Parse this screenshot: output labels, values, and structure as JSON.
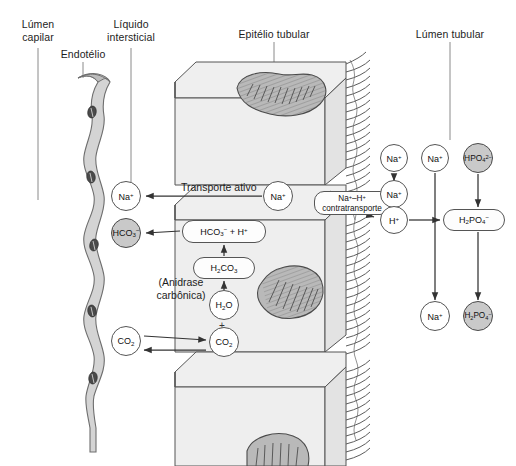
{
  "figure": {
    "language": "pt-BR",
    "background": "#ffffff",
    "ink": "#1d1d1d"
  },
  "region_labels": [
    {
      "id": "lumen-capilar",
      "text": "Lúmen\ncapilar",
      "x": 8,
      "y": 18,
      "w": 60,
      "leader": {
        "x": 38,
        "y1": 48,
        "y2": 200
      }
    },
    {
      "id": "liquido-intersticial",
      "text": "Líquido\nintersticial",
      "x": 94,
      "y": 18,
      "w": 74,
      "leader": {
        "x": 131,
        "y1": 48,
        "y2": 200
      }
    },
    {
      "id": "endotelio",
      "text": "Endotélio",
      "x": 52,
      "y": 48,
      "w": 62,
      "leader": {
        "x": 83,
        "y1": 62,
        "y2": 78
      }
    },
    {
      "id": "epitelio-tubular",
      "text": "Epitélio tubular",
      "x": 226,
      "y": 28,
      "w": 96,
      "leader": {
        "x": 274,
        "y1": 42,
        "y2": 80
      }
    },
    {
      "id": "lumen-tubular",
      "text": "Lúmen tubular",
      "x": 404,
      "y": 28,
      "w": 92,
      "leader": {
        "x": 450,
        "y1": 42,
        "y2": 140
      }
    }
  ],
  "inline_labels": [
    {
      "id": "transporte-ativo",
      "text": "Transporte ativo",
      "x": 181,
      "y": 181,
      "w": 104,
      "align": "left"
    },
    {
      "id": "anidrase-carbonica",
      "text": "(Anidrase\ncarbônica)",
      "x": 147,
      "y": 276,
      "w": 68,
      "align": "center"
    }
  ],
  "nodes": [
    {
      "id": "na-interstitial",
      "label": "Na+",
      "html": "Na<sup>+</sup>",
      "shape": "circle",
      "fill": "white",
      "cx": 126,
      "cy": 196,
      "r": 15
    },
    {
      "id": "hco3-interstitial",
      "label": "HCO3-",
      "html": "HCO<sub>3</sub><sup>−</sup>",
      "shape": "circle",
      "fill": "gray",
      "cx": 126,
      "cy": 233,
      "r": 15
    },
    {
      "id": "co2-interstitial",
      "label": "CO2",
      "html": "CO<sub>2</sub>",
      "shape": "circle",
      "fill": "white",
      "cx": 126,
      "cy": 341,
      "r": 15
    },
    {
      "id": "na-cell",
      "label": "Na+",
      "html": "Na<sup>+</sup>",
      "shape": "circle",
      "fill": "white",
      "cx": 278,
      "cy": 196,
      "r": 15
    },
    {
      "id": "hco3-h-cell",
      "label": "HCO3- + H+",
      "html": "HCO<sub>3</sub><sup>−</sup> + H<sup>+</sup>",
      "shape": "pill",
      "fill": "white",
      "cx": 224,
      "cy": 231,
      "w": 84,
      "h": 23
    },
    {
      "id": "h2co3-cell",
      "label": "H2CO3",
      "html": "H<sub>2</sub>CO<sub>3</sub>",
      "shape": "pill",
      "fill": "white",
      "cx": 224,
      "cy": 268,
      "w": 62,
      "h": 22
    },
    {
      "id": "h2o-cell",
      "label": "H2O",
      "html": "H<sub>2</sub>O",
      "shape": "circle",
      "fill": "white",
      "cx": 224,
      "cy": 305,
      "r": 15
    },
    {
      "id": "co2-cell",
      "label": "CO2",
      "html": "CO<sub>2</sub>",
      "shape": "circle",
      "fill": "white",
      "cx": 224,
      "cy": 342,
      "r": 15
    },
    {
      "id": "contratransporte",
      "label": "Na+–H+ contratransporte",
      "html": "Na<sup>+</sup>–H<sup>+</sup><br>contratransporte",
      "shape": "pill2",
      "fill": "white",
      "cx": 352,
      "cy": 203,
      "w": 76,
      "h": 24
    },
    {
      "id": "na-lumen-top",
      "label": "Na+",
      "html": "Na<sup>+</sup>",
      "shape": "circle",
      "fill": "white",
      "cx": 394,
      "cy": 158,
      "r": 14
    },
    {
      "id": "na-lumen-mid",
      "label": "Na+",
      "html": "Na<sup>+</sup>",
      "shape": "circle",
      "fill": "white",
      "cx": 394,
      "cy": 194,
      "r": 14
    },
    {
      "id": "h-lumen",
      "label": "H+",
      "html": "H<sup>+</sup>",
      "shape": "circle",
      "fill": "white",
      "cx": 394,
      "cy": 220,
      "r": 14
    },
    {
      "id": "na-lumen-free",
      "label": "Na+",
      "html": "Na<sup>+</sup>",
      "shape": "circle",
      "fill": "white",
      "cx": 435,
      "cy": 158,
      "r": 14
    },
    {
      "id": "hpo4-lumen",
      "label": "HPO4 2-",
      "html": "HPO<sub>4</sub><sup>2−</sup>",
      "shape": "circle",
      "fill": "gray",
      "cx": 478,
      "cy": 158,
      "r": 15
    },
    {
      "id": "h2po4-lumen",
      "label": "H2PO4-",
      "html": "H<sub>2</sub>PO<sub>4</sub><sup>−</sup>",
      "shape": "pill",
      "fill": "white",
      "cx": 474,
      "cy": 220,
      "w": 62,
      "h": 22
    },
    {
      "id": "na-lumen-bottom",
      "label": "Na+",
      "html": "Na<sup>+</sup>",
      "shape": "circle",
      "fill": "white",
      "cx": 435,
      "cy": 316,
      "r": 15
    },
    {
      "id": "h2po4-excreted",
      "label": "H2PO4-",
      "html": "H<sub>2</sub>PO<sub>4</sub><sup>−</sup>",
      "shape": "circle",
      "fill": "gray",
      "cx": 478,
      "cy": 316,
      "r": 15
    }
  ],
  "structures": {
    "endothelium": {
      "id": "capillary-endothelium",
      "nuclei": 5,
      "fill": "#d0d0d0"
    },
    "epithelial_cells": [
      {
        "id": "epithelial-cell-top",
        "mitochondria": 1
      },
      {
        "id": "epithelial-cell-middle",
        "mitochondria": 1
      },
      {
        "id": "epithelial-cell-bottom",
        "mitochondria": 1
      }
    ],
    "brush_border": {
      "id": "brush-border-microvilli",
      "side": "apical-right"
    }
  }
}
